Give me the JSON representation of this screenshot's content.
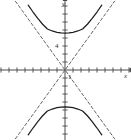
{
  "figure": {
    "name": "hyperbola-graph",
    "background": "#ffffff",
    "width": 131,
    "height": 140
  },
  "axes": {
    "x_axis_label": "x",
    "y_axis_label": "y",
    "origin_px": [
      65,
      70
    ],
    "unit_px": 8,
    "axis_color": "#4a4a4a",
    "x_range": [
      -8.1,
      8.2
    ],
    "y_range": [
      -8.75,
      8.75
    ],
    "x_tick_values": [
      -8,
      -7,
      -6,
      -5,
      -4,
      -3,
      -2,
      -1,
      1,
      2,
      3,
      4,
      5,
      6,
      7,
      8
    ],
    "y_tick_values": [
      -8,
      -7,
      -6,
      -5,
      -4,
      -3,
      -2,
      -1,
      1,
      2,
      3,
      4,
      5,
      6,
      7,
      8
    ],
    "arrow_x": "right",
    "arrow_y": "up"
  },
  "tick_labels": [
    {
      "text": "4",
      "value": 4,
      "axis": "y",
      "x_px": 55,
      "y_px": 43
    },
    {
      "text": "1",
      "value": 1,
      "axis": "x",
      "x_px": 68,
      "y_px": 74
    }
  ],
  "chart_data": {
    "type": "line",
    "title": "",
    "xlabel": "x",
    "ylabel": "y",
    "xlim": [
      -8.1,
      8.2
    ],
    "ylim": [
      -8.75,
      8.75
    ],
    "grid": false,
    "legend": null,
    "curve_color": "#1f1f1f",
    "asymptote_color": "#555555",
    "hyperbola": {
      "center": [
        0,
        0
      ],
      "orientation": "vertical",
      "a": 4.6,
      "b": 3.3,
      "vertices": [
        [
          0,
          4.6
        ],
        [
          0,
          -4.6
        ]
      ],
      "asymptote_slopes": [
        1.394,
        -1.394
      ]
    },
    "series": [
      {
        "name": "upper-branch",
        "style": "solid",
        "points": [
          [
            -4.6,
            8.1
          ],
          [
            -4.0,
            7.25
          ],
          [
            -3.4,
            6.45
          ],
          [
            -2.8,
            5.72
          ],
          [
            -2.2,
            5.12
          ],
          [
            -1.6,
            4.88
          ],
          [
            -1.0,
            4.71
          ],
          [
            -0.5,
            4.63
          ],
          [
            0.0,
            4.6
          ],
          [
            0.5,
            4.63
          ],
          [
            1.0,
            4.71
          ],
          [
            1.6,
            4.88
          ],
          [
            2.2,
            5.12
          ],
          [
            2.8,
            5.72
          ],
          [
            3.4,
            6.45
          ],
          [
            4.0,
            7.25
          ],
          [
            4.6,
            8.1
          ]
        ]
      },
      {
        "name": "lower-branch",
        "style": "solid",
        "points": [
          [
            -4.6,
            -8.1
          ],
          [
            -4.0,
            -7.25
          ],
          [
            -3.4,
            -6.45
          ],
          [
            -2.8,
            -5.72
          ],
          [
            -2.2,
            -5.12
          ],
          [
            -1.6,
            -4.88
          ],
          [
            -1.0,
            -4.71
          ],
          [
            -0.5,
            -4.63
          ],
          [
            0.0,
            -4.6
          ],
          [
            0.5,
            -4.63
          ],
          [
            1.0,
            -4.71
          ],
          [
            1.6,
            -4.88
          ],
          [
            2.2,
            -5.12
          ],
          [
            2.8,
            -5.72
          ],
          [
            3.4,
            -6.45
          ],
          [
            4.0,
            -7.25
          ],
          [
            4.6,
            -8.1
          ]
        ]
      },
      {
        "name": "asymptote-positive-slope",
        "style": "dashed",
        "points": [
          [
            -6.2,
            -8.6
          ],
          [
            6.2,
            8.6
          ]
        ]
      },
      {
        "name": "asymptote-negative-slope",
        "style": "dashed",
        "points": [
          [
            -6.2,
            8.6
          ],
          [
            6.2,
            -8.6
          ]
        ]
      }
    ]
  }
}
